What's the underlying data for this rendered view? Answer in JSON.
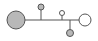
{
  "diagram": {
    "width": 98,
    "height": 41,
    "stroke_color": "#555555",
    "gray_fill": "#b8b8b8",
    "white_fill": "#ffffff",
    "trunk": {
      "x1": 25,
      "y1": 20,
      "x2": 79,
      "y2": 20
    },
    "nodes": [
      {
        "name": "source-node",
        "cx": 16,
        "cy": 20,
        "r": 9,
        "fill": "gray"
      },
      {
        "name": "branch-node-top-left",
        "cx": 41,
        "cy": 7,
        "r": 3,
        "fill": "gray",
        "stem": {
          "x": 41,
          "y1": 10,
          "y2": 20
        }
      },
      {
        "name": "branch-node-top-right",
        "cx": 62,
        "cy": 13,
        "r": 2.5,
        "fill": "white",
        "stem": {
          "x": 62,
          "y1": 15.5,
          "y2": 20
        }
      },
      {
        "name": "branch-node-bottom",
        "cx": 70,
        "cy": 33,
        "r": 3.5,
        "fill": "gray",
        "stem": {
          "x": 70,
          "y1": 20,
          "y2": 29.5
        }
      },
      {
        "name": "sink-node",
        "cx": 85,
        "cy": 20,
        "r": 6,
        "fill": "white"
      }
    ]
  }
}
